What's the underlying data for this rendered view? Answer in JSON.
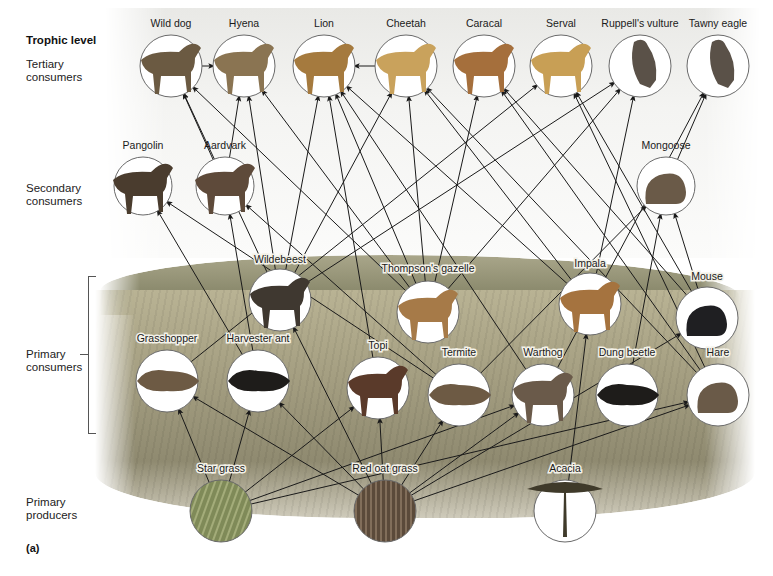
{
  "figure": {
    "panel_label": "(a)",
    "level_heading": "Trophic level",
    "levels": [
      {
        "id": "tertiary",
        "label": "Tertiary\nconsumers"
      },
      {
        "id": "secondary",
        "label": "Secondary\nconsumers"
      },
      {
        "id": "primary_consumers",
        "label": "Primary\nconsumers"
      },
      {
        "id": "producers",
        "label": "Primary\nproducers"
      }
    ]
  },
  "colors": {
    "arrow": "#1a1a1a",
    "circle_stroke": "#6a6a6a",
    "circle_fill": "#ffffff",
    "sky": "#f0efea",
    "grass": "#a39d80",
    "hills": "#8b8a6d",
    "animal_fill": "#5a5148",
    "plant_fill": "#6d7a4a"
  },
  "nodes": [
    {
      "id": "wild_dog",
      "label": "Wild dog",
      "level": "tertiary",
      "icon": "wild-dog-icon"
    },
    {
      "id": "hyena",
      "label": "Hyena",
      "level": "tertiary",
      "icon": "hyena-icon"
    },
    {
      "id": "lion",
      "label": "Lion",
      "level": "tertiary",
      "icon": "lion-icon"
    },
    {
      "id": "cheetah",
      "label": "Cheetah",
      "level": "tertiary",
      "icon": "cheetah-icon"
    },
    {
      "id": "caracal",
      "label": "Caracal",
      "level": "tertiary",
      "icon": "caracal-icon"
    },
    {
      "id": "serval",
      "label": "Serval",
      "level": "tertiary",
      "icon": "serval-icon"
    },
    {
      "id": "vulture",
      "label": "Ruppell's vulture",
      "level": "tertiary",
      "icon": "vulture-icon"
    },
    {
      "id": "eagle",
      "label": "Tawny eagle",
      "level": "tertiary",
      "icon": "eagle-icon"
    },
    {
      "id": "pangolin",
      "label": "Pangolin",
      "level": "secondary",
      "icon": "pangolin-icon"
    },
    {
      "id": "aardvark",
      "label": "Aardvark",
      "level": "secondary",
      "icon": "aardvark-icon"
    },
    {
      "id": "mongoose",
      "label": "Mongoose",
      "level": "secondary",
      "icon": "mongoose-icon"
    },
    {
      "id": "wildebeest",
      "label": "Wildebeest",
      "level": "primary_consumers",
      "icon": "wildebeest-icon"
    },
    {
      "id": "gazelle",
      "label": "Thompson's gazelle",
      "level": "primary_consumers",
      "icon": "gazelle-icon"
    },
    {
      "id": "impala",
      "label": "Impala",
      "level": "primary_consumers",
      "icon": "impala-icon"
    },
    {
      "id": "mouse",
      "label": "Mouse",
      "level": "primary_consumers",
      "icon": "mouse-icon"
    },
    {
      "id": "grasshopper",
      "label": "Grasshopper",
      "level": "primary_consumers",
      "icon": "grasshopper-icon"
    },
    {
      "id": "ant",
      "label": "Harvester ant",
      "level": "primary_consumers",
      "icon": "ant-icon"
    },
    {
      "id": "topi",
      "label": "Topi",
      "level": "primary_consumers",
      "icon": "topi-icon"
    },
    {
      "id": "termite",
      "label": "Termite",
      "level": "primary_consumers",
      "icon": "termite-icon"
    },
    {
      "id": "warthog",
      "label": "Warthog",
      "level": "primary_consumers",
      "icon": "warthog-icon"
    },
    {
      "id": "dung_beetle",
      "label": "Dung beetle",
      "level": "primary_consumers",
      "icon": "beetle-icon"
    },
    {
      "id": "hare",
      "label": "Hare",
      "level": "primary_consumers",
      "icon": "hare-icon"
    },
    {
      "id": "star_grass",
      "label": "Star grass",
      "level": "producers",
      "icon": "star-grass-icon"
    },
    {
      "id": "red_oat_grass",
      "label": "Red oat grass",
      "level": "producers",
      "icon": "red-oat-grass-icon"
    },
    {
      "id": "acacia",
      "label": "Acacia",
      "level": "producers",
      "icon": "acacia-icon"
    }
  ],
  "edges": [
    [
      "wild_dog",
      "hyena"
    ],
    [
      "cheetah",
      "lion"
    ],
    [
      "aardvark",
      "wild_dog"
    ],
    [
      "wildebeest",
      "wild_dog"
    ],
    [
      "gazelle",
      "wild_dog"
    ],
    [
      "aardvark",
      "hyena"
    ],
    [
      "wildebeest",
      "hyena"
    ],
    [
      "gazelle",
      "hyena"
    ],
    [
      "wildebeest",
      "lion"
    ],
    [
      "gazelle",
      "lion"
    ],
    [
      "impala",
      "lion"
    ],
    [
      "topi",
      "lion"
    ],
    [
      "warthog",
      "lion"
    ],
    [
      "wildebeest",
      "cheetah"
    ],
    [
      "gazelle",
      "cheetah"
    ],
    [
      "impala",
      "cheetah"
    ],
    [
      "hare",
      "cheetah"
    ],
    [
      "gazelle",
      "caracal"
    ],
    [
      "mouse",
      "caracal"
    ],
    [
      "hare",
      "caracal"
    ],
    [
      "grasshopper",
      "serval"
    ],
    [
      "mouse",
      "serval"
    ],
    [
      "hare",
      "serval"
    ],
    [
      "wildebeest",
      "vulture"
    ],
    [
      "gazelle",
      "vulture"
    ],
    [
      "impala",
      "vulture"
    ],
    [
      "warthog",
      "eagle"
    ],
    [
      "mongoose",
      "eagle"
    ],
    [
      "ant",
      "pangolin"
    ],
    [
      "termite",
      "pangolin"
    ],
    [
      "ant",
      "aardvark"
    ],
    [
      "termite",
      "aardvark"
    ],
    [
      "dung_beetle",
      "mongoose"
    ],
    [
      "termite",
      "mongoose"
    ],
    [
      "mouse",
      "mongoose"
    ],
    [
      "star_grass",
      "grasshopper"
    ],
    [
      "red_oat_grass",
      "grasshopper"
    ],
    [
      "star_grass",
      "ant"
    ],
    [
      "red_oat_grass",
      "ant"
    ],
    [
      "star_grass",
      "topi"
    ],
    [
      "red_oat_grass",
      "topi"
    ],
    [
      "red_oat_grass",
      "termite"
    ],
    [
      "star_grass",
      "warthog"
    ],
    [
      "red_oat_grass",
      "warthog"
    ],
    [
      "star_grass",
      "hare"
    ],
    [
      "red_oat_grass",
      "hare"
    ],
    [
      "red_oat_grass",
      "wildebeest"
    ],
    [
      "acacia",
      "impala"
    ],
    [
      "red_oat_grass",
      "mouse"
    ]
  ]
}
